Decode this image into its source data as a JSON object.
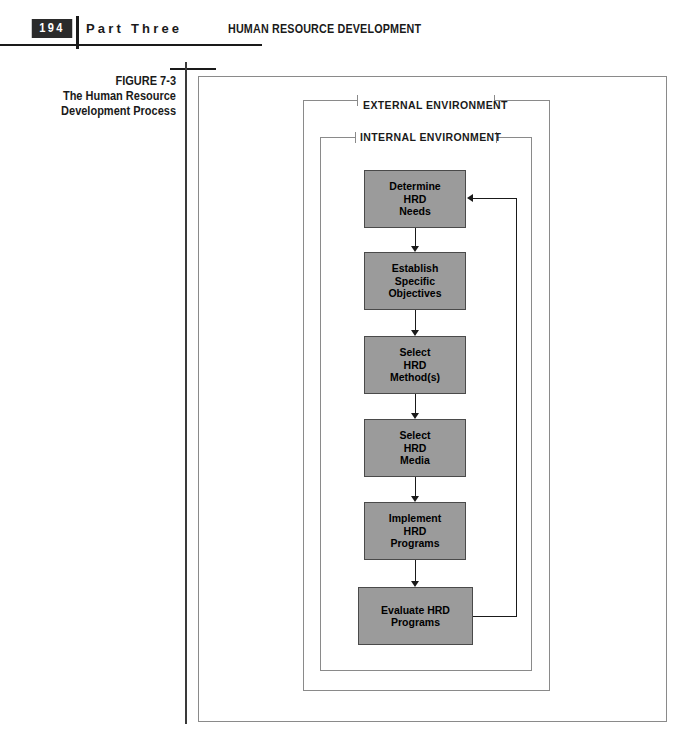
{
  "header": {
    "page_number": "194",
    "part_label": "Part Three",
    "chapter_title": "HUMAN RESOURCE DEVELOPMENT"
  },
  "figure": {
    "number": "FIGURE 7-3",
    "title": "The Human Resource Development Process"
  },
  "diagram": {
    "external_environment_label": "EXTERNAL ENVIRONMENT",
    "internal_environment_label": "INTERNAL ENVIRONMENT",
    "boxes": [
      {
        "id": "determine",
        "label": "Determine\nHRD\nNeeds"
      },
      {
        "id": "establish",
        "label": "Establish\nSpecific\nObjectives"
      },
      {
        "id": "method",
        "label": "Select\nHRD\nMethod(s)"
      },
      {
        "id": "media",
        "label": "Select\nHRD\nMedia"
      },
      {
        "id": "implement",
        "label": "Implement\nHRD\nPrograms"
      },
      {
        "id": "evaluate",
        "label": "Evaluate HRD\nPrograms"
      }
    ]
  },
  "colors": {
    "box_fill": "#9b9b9b",
    "box_border": "#4a4a4a",
    "frame_line": "#8a8a8a",
    "ink": "#1a1a1a",
    "page_number_bg": "#2b2b2b",
    "page_number_fg": "#ffffff"
  }
}
